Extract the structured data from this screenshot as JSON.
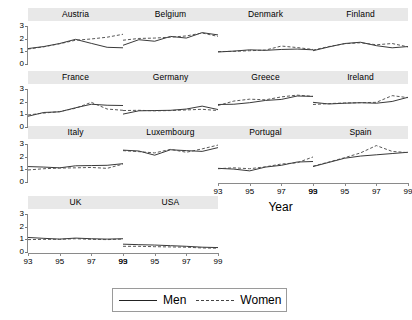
{
  "chart_data": {
    "type": "line",
    "title": "",
    "xlabel": "Year",
    "ylabel": "",
    "xlim": [
      93,
      99
    ],
    "ylim": [
      0,
      3.4
    ],
    "xticks": [
      "93",
      "95",
      "97",
      "99"
    ],
    "xtick_values": [
      93,
      95,
      97,
      99
    ],
    "yticks": [
      "0",
      "1",
      "2",
      "3"
    ],
    "ytick_values": [
      0,
      1,
      2,
      3
    ],
    "grid": false,
    "legend_position": "bottom-center",
    "x": [
      93,
      94,
      95,
      96,
      97,
      98,
      99
    ],
    "legend": [
      {
        "name": "Men",
        "style": "solid",
        "color": "#222222"
      },
      {
        "name": "Women",
        "style": "dashed",
        "color": "#444444"
      }
    ],
    "panel_layout": {
      "rows": 4,
      "cols": 4,
      "panels_in_last_row": 2
    },
    "panels": [
      {
        "name": "Austria",
        "row": 0,
        "col": 0,
        "series": [
          {
            "name": "Men",
            "values": [
              1.22,
              1.38,
              1.62,
              1.95,
              1.63,
              1.32,
              1.28
            ]
          },
          {
            "name": "Women",
            "values": [
              1.18,
              1.36,
              1.6,
              1.88,
              1.98,
              2.12,
              2.35
            ]
          }
        ]
      },
      {
        "name": "Belgium",
        "row": 0,
        "col": 1,
        "series": [
          {
            "name": "Men",
            "values": [
              1.48,
              1.92,
              1.8,
              2.18,
              2.05,
              2.48,
              2.3
            ]
          },
          {
            "name": "Women",
            "values": [
              1.88,
              2.02,
              2.05,
              2.12,
              2.22,
              2.45,
              2.18
            ]
          }
        ]
      },
      {
        "name": "Denmark",
        "row": 0,
        "col": 2,
        "series": [
          {
            "name": "Men",
            "values": [
              0.95,
              1.02,
              1.12,
              1.08,
              1.15,
              1.18,
              1.12
            ]
          },
          {
            "name": "Women",
            "values": [
              0.98,
              1.0,
              1.05,
              1.1,
              1.42,
              1.3,
              1.15
            ]
          }
        ]
      },
      {
        "name": "Finland",
        "row": 0,
        "col": 3,
        "series": [
          {
            "name": "Men",
            "values": [
              1.05,
              1.35,
              1.62,
              1.72,
              1.45,
              1.28,
              1.38
            ]
          },
          {
            "name": "Women",
            "values": [
              1.1,
              1.38,
              1.6,
              1.68,
              1.52,
              1.62,
              1.35
            ]
          }
        ]
      },
      {
        "name": "France",
        "row": 1,
        "col": 0,
        "series": [
          {
            "name": "Men",
            "values": [
              0.85,
              1.15,
              1.2,
              1.52,
              1.8,
              1.72,
              1.7
            ]
          },
          {
            "name": "Women",
            "values": [
              0.95,
              1.1,
              1.22,
              1.48,
              1.95,
              1.42,
              1.32
            ]
          }
        ]
      },
      {
        "name": "Germany",
        "row": 1,
        "col": 1,
        "series": [
          {
            "name": "Men",
            "values": [
              1.02,
              1.28,
              1.3,
              1.32,
              1.42,
              1.65,
              1.38
            ]
          },
          {
            "name": "Women",
            "values": [
              1.3,
              1.32,
              1.28,
              1.3,
              1.35,
              1.4,
              1.3
            ]
          }
        ]
      },
      {
        "name": "Greece",
        "row": 1,
        "col": 2,
        "series": [
          {
            "name": "Men",
            "values": [
              1.78,
              1.8,
              1.92,
              2.1,
              2.18,
              2.45,
              2.42
            ]
          },
          {
            "name": "Women",
            "values": [
              1.7,
              2.05,
              2.2,
              2.15,
              2.38,
              2.52,
              2.42
            ]
          }
        ]
      },
      {
        "name": "Ireland",
        "row": 1,
        "col": 3,
        "series": [
          {
            "name": "Men",
            "values": [
              1.95,
              1.82,
              1.88,
              1.92,
              1.88,
              2.02,
              2.35
            ]
          },
          {
            "name": "Women",
            "values": [
              1.78,
              1.85,
              1.9,
              1.92,
              1.95,
              2.48,
              2.32
            ]
          }
        ]
      },
      {
        "name": "Italy",
        "row": 2,
        "col": 0,
        "series": [
          {
            "name": "Men",
            "values": [
              1.22,
              1.18,
              1.12,
              1.28,
              1.3,
              1.32,
              1.45
            ]
          },
          {
            "name": "Women",
            "values": [
              0.95,
              1.05,
              1.1,
              1.12,
              1.15,
              1.08,
              1.42
            ]
          }
        ]
      },
      {
        "name": "Luxembourg",
        "row": 2,
        "col": 1,
        "series": [
          {
            "name": "Men",
            "values": [
              2.52,
              2.45,
              2.12,
              2.55,
              2.48,
              2.42,
              2.72
            ]
          },
          {
            "name": "Women",
            "values": [
              2.48,
              2.4,
              2.3,
              2.58,
              2.35,
              2.62,
              2.92
            ]
          }
        ]
      },
      {
        "name": "Portugal",
        "row": 2,
        "col": 2,
        "series": [
          {
            "name": "Men",
            "values": [
              1.08,
              1.02,
              0.88,
              1.18,
              1.32,
              1.58,
              1.62
            ]
          },
          {
            "name": "Women",
            "values": [
              1.05,
              1.12,
              1.05,
              1.2,
              1.42,
              1.52,
              1.98
            ]
          }
        ]
      },
      {
        "name": "Spain",
        "row": 2,
        "col": 3,
        "series": [
          {
            "name": "Men",
            "values": [
              1.22,
              1.55,
              1.88,
              2.05,
              2.15,
              2.25,
              2.35
            ]
          },
          {
            "name": "Women",
            "values": [
              1.25,
              1.58,
              1.92,
              2.3,
              2.88,
              2.42,
              2.32
            ]
          }
        ]
      },
      {
        "name": "UK",
        "row": 3,
        "col": 0,
        "series": [
          {
            "name": "Men",
            "values": [
              1.15,
              1.08,
              1.02,
              1.1,
              1.05,
              1.02,
              1.05
            ]
          },
          {
            "name": "Women",
            "values": [
              0.98,
              1.0,
              1.0,
              1.05,
              1.0,
              0.98,
              1.02
            ]
          }
        ]
      },
      {
        "name": "USA",
        "row": 3,
        "col": 1,
        "series": [
          {
            "name": "Men",
            "values": [
              0.62,
              0.58,
              0.55,
              0.5,
              0.45,
              0.38,
              0.35
            ]
          },
          {
            "name": "Women",
            "values": [
              0.45,
              0.45,
              0.42,
              0.4,
              0.38,
              0.32,
              0.3
            ]
          }
        ]
      }
    ]
  }
}
